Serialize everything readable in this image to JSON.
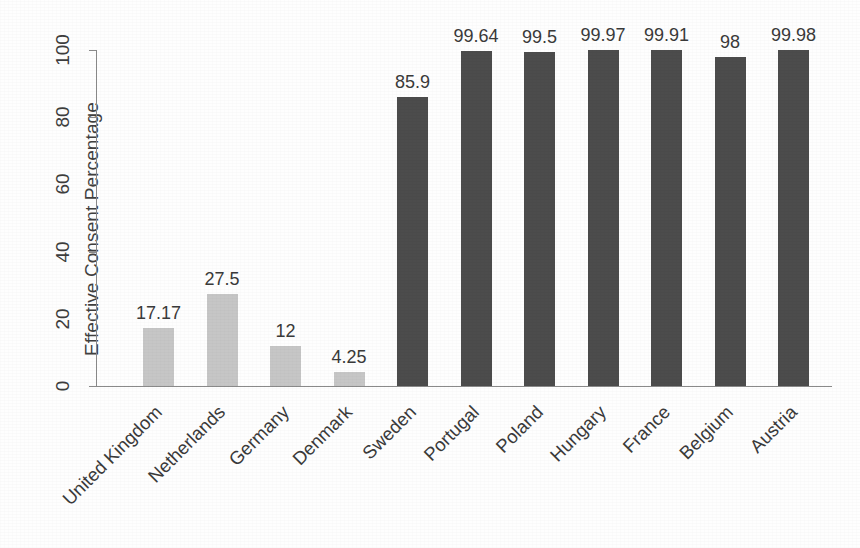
{
  "chart_data": {
    "type": "bar",
    "title": "",
    "subtitle": "",
    "xlabel": "",
    "ylabel": "Effective Consent Percentage",
    "categories": [
      "United Kingdom",
      "Netherlands",
      "Germany",
      "Denmark",
      "Sweden",
      "Portugal",
      "Poland",
      "Hungary",
      "France",
      "Belgium",
      "Austria"
    ],
    "values": [
      17.17,
      27.5,
      12,
      4.25,
      85.9,
      99.64,
      99.5,
      99.97,
      99.91,
      98,
      99.98
    ],
    "value_labels": [
      "17.17",
      "27.5",
      "12",
      "4.25",
      "85.9",
      "99.64",
      "99.5",
      "99.97",
      "99.91",
      "98",
      "99.98"
    ],
    "bar_colors": [
      "#c6c6c6",
      "#c6c6c6",
      "#c6c6c6",
      "#c6c6c6",
      "#4c4c4c",
      "#4c4c4c",
      "#4c4c4c",
      "#4c4c4c",
      "#4c4c4c",
      "#4c4c4c",
      "#4c4c4c"
    ],
    "ylim": [
      0,
      100
    ],
    "yticks": [
      0,
      20,
      40,
      60,
      80,
      100
    ],
    "ytick_labels": [
      "0",
      "20",
      "40",
      "60",
      "80",
      "100"
    ],
    "grid": false,
    "legend": false,
    "legend_position": "none",
    "x_label_rotation": -45,
    "y_label_rotation": -90,
    "annotations": []
  },
  "colors": {
    "light_bar": "#c6c6c6",
    "dark_bar": "#4c4c4c",
    "axis": "#8a8a8a",
    "text": "#3a3a3a",
    "background": "#fefefe"
  }
}
